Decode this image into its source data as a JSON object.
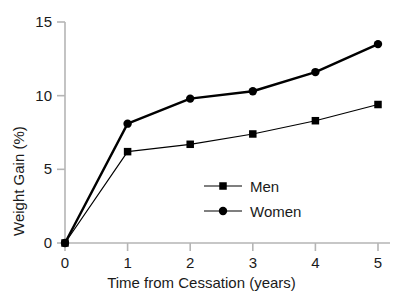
{
  "chart_data": {
    "type": "line",
    "title": "",
    "xlabel": "Time from Cessation (years)",
    "ylabel": "Weight Gain (%)",
    "x": [
      0,
      1,
      2,
      3,
      4,
      5
    ],
    "xticklabels": [
      "0",
      "1",
      "2",
      "3",
      "4",
      "5"
    ],
    "yticks": [
      0,
      5,
      10,
      15
    ],
    "yticklabels": [
      "0",
      "5",
      "10",
      "15"
    ],
    "xlim": [
      0,
      5
    ],
    "ylim": [
      0,
      15
    ],
    "grid": false,
    "legend_position": "center",
    "series": [
      {
        "name": "Men",
        "marker": "square",
        "color": "#000000",
        "linewidth": 1.2,
        "values": [
          0,
          6.2,
          6.7,
          7.4,
          8.3,
          9.4
        ]
      },
      {
        "name": "Women",
        "marker": "circle",
        "color": "#000000",
        "linewidth": 2.4,
        "values": [
          0,
          8.1,
          9.8,
          10.3,
          11.6,
          13.5
        ]
      }
    ]
  },
  "legend": {
    "entries": [
      {
        "label": "Men",
        "marker": "square"
      },
      {
        "label": "Women",
        "marker": "circle"
      }
    ]
  },
  "colors": {
    "axis": "#b5b5b5",
    "series": "#000000",
    "text": "#1a1a1a",
    "background": "#ffffff"
  }
}
